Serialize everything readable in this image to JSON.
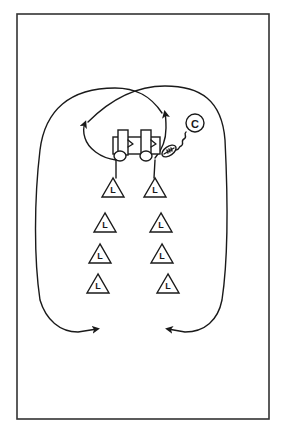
{
  "diagram": {
    "type": "football-drill",
    "colors": {
      "ink": "#1a1a1a",
      "frame": "#333333",
      "background": "#ffffff"
    },
    "coach": {
      "label": "C",
      "icon": "coach-circle-icon"
    },
    "ball": {
      "icon": "football-icon"
    },
    "equipment": [
      {
        "icon": "blocking-dummy-icon",
        "name": "left-dummy"
      },
      {
        "icon": "blocking-dummy-icon",
        "name": "right-dummy"
      },
      {
        "icon": "blocking-sled-icon",
        "name": "sled-base"
      }
    ],
    "players": {
      "left_column": [
        "L",
        "L",
        "L",
        "L"
      ],
      "right_column": [
        "L",
        "L",
        "L",
        "L"
      ]
    },
    "paths": [
      {
        "name": "left-inner-arrow",
        "description": "from left lead player loop up to left of dummies"
      },
      {
        "name": "right-inner-arrow",
        "description": "from right lead player loop up to right of dummies"
      },
      {
        "name": "left-outer-return-arrow",
        "description": "crossing loop returning down left side to bottom"
      },
      {
        "name": "right-outer-return-arrow",
        "description": "crossing loop returning down right side to bottom"
      }
    ]
  }
}
